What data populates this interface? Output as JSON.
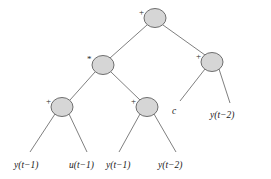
{
  "figure": {
    "type": "expression-tree",
    "background_color": "#ffffff",
    "node_fill_color": "#d6d6d6",
    "node_stroke_color": "#6e6e6e",
    "edge_color": "#808080"
  },
  "nodes": [
    {
      "id": "n1",
      "role": "root",
      "operator": "+",
      "cx": 155,
      "cy": 18,
      "rx": 11,
      "ry": 9.5,
      "label_x": 139,
      "label_y": 8
    },
    {
      "id": "n2",
      "role": "internal-left",
      "operator": "*",
      "cx": 103,
      "cy": 65,
      "rx": 11,
      "ry": 9.5,
      "label_x": 87,
      "label_y": 55
    },
    {
      "id": "n3",
      "role": "internal-right",
      "operator": "+",
      "cx": 212,
      "cy": 62,
      "rx": 11,
      "ry": 9.5,
      "label_x": 196,
      "label_y": 52
    },
    {
      "id": "n4",
      "role": "internal-left-left",
      "operator": "+",
      "cx": 62,
      "cy": 107,
      "rx": 11,
      "ry": 9.5,
      "label_x": 46,
      "label_y": 97
    },
    {
      "id": "n5",
      "role": "internal-left-right",
      "operator": "+",
      "cx": 147,
      "cy": 107,
      "rx": 11,
      "ry": 9.5,
      "label_x": 131,
      "label_y": 97
    }
  ],
  "leaves": [
    {
      "id": "l1",
      "text": "y(t−1)",
      "var": "y",
      "delay": "1",
      "x": 14,
      "y": 160
    },
    {
      "id": "l2",
      "text": "u(t−1)",
      "var": "u",
      "delay": "1",
      "x": 69,
      "y": 160
    },
    {
      "id": "l3",
      "text": "y(t−1)",
      "var": "y",
      "delay": "1",
      "x": 106,
      "y": 160
    },
    {
      "id": "l4",
      "text": "y(t−2)",
      "var": "y",
      "delay": "2",
      "x": 158,
      "y": 160
    },
    {
      "id": "l5",
      "text": "c",
      "var": "c",
      "delay": "",
      "x": 172,
      "y": 106
    },
    {
      "id": "l6",
      "text": "y(t−2)",
      "var": "y",
      "delay": "2",
      "x": 210,
      "y": 110
    }
  ],
  "edges": [
    {
      "from": "n1",
      "to": "n2",
      "x1": 147,
      "y1": 25,
      "x2": 110,
      "y2": 58
    },
    {
      "from": "n1",
      "to": "n3",
      "x1": 163,
      "y1": 25,
      "x2": 205,
      "y2": 55
    },
    {
      "from": "n2",
      "to": "n4",
      "x1": 95,
      "y1": 72,
      "x2": 70,
      "y2": 100
    },
    {
      "from": "n2",
      "to": "n5",
      "x1": 111,
      "y1": 72,
      "x2": 140,
      "y2": 100
    },
    {
      "from": "n3",
      "to": "l5",
      "x1": 205,
      "y1": 69,
      "x2": 180,
      "y2": 101
    },
    {
      "from": "n3",
      "to": "l6",
      "x1": 219,
      "y1": 69,
      "x2": 230,
      "y2": 103
    },
    {
      "from": "n4",
      "to": "l1",
      "x1": 55,
      "y1": 114,
      "x2": 30,
      "y2": 152
    },
    {
      "from": "n4",
      "to": "l2",
      "x1": 69,
      "y1": 114,
      "x2": 87,
      "y2": 152
    },
    {
      "from": "n5",
      "to": "l3",
      "x1": 140,
      "y1": 114,
      "x2": 119,
      "y2": 152
    },
    {
      "from": "n5",
      "to": "l4",
      "x1": 154,
      "y1": 114,
      "x2": 176,
      "y2": 152
    }
  ]
}
